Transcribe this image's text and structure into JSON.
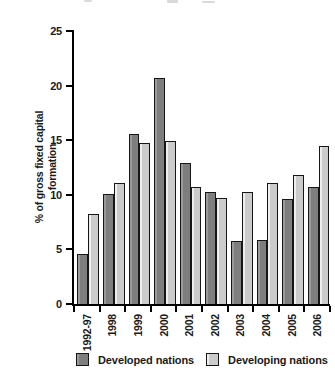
{
  "figure": {
    "width": 335,
    "height": 390,
    "background": "#ffffff",
    "text_color": "#1a1a1a",
    "axis_color": "#000000"
  },
  "chart_data": {
    "type": "bar",
    "title": "",
    "xlabel": "",
    "ylabel": "% of gross fixed capital formation",
    "ylabel_lines": [
      "% of gross fixed capital",
      "formation"
    ],
    "categories": [
      "1992-97",
      "1998",
      "1999",
      "2000",
      "2001",
      "2002",
      "2003",
      "2004",
      "2005",
      "2006"
    ],
    "series": [
      {
        "name": "Developed nations",
        "color": "#7e7e7e",
        "highlight": "#9a9a9a",
        "values": [
          4.6,
          10.1,
          15.6,
          20.7,
          12.9,
          10.3,
          5.8,
          5.9,
          9.6,
          10.7
        ]
      },
      {
        "name": "Developing nations",
        "color": "#cbcbcb",
        "highlight": "#eeeeee",
        "values": [
          8.2,
          11.1,
          14.7,
          14.9,
          10.7,
          9.7,
          10.3,
          11.1,
          11.8,
          14.5
        ]
      }
    ],
    "ylim": [
      0,
      25
    ],
    "yticks": [
      0,
      5,
      10,
      15,
      20,
      25
    ],
    "grid": false,
    "legend_position": "bottom",
    "bar_border_color": "#161616"
  }
}
